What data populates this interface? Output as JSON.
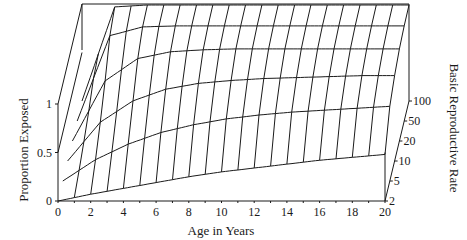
{
  "chart_data": {
    "type": "surface",
    "title": "",
    "xlabel": "Age in Years",
    "ylabel": "Proportion Exposed",
    "zlabel": "Basic Reproductive Rate",
    "x_ticks": [
      0,
      2,
      4,
      6,
      8,
      10,
      12,
      14,
      16,
      18,
      20
    ],
    "x_minor_step": 1,
    "xlim": [
      0,
      20
    ],
    "y_ticks": [
      0,
      0.5,
      1
    ],
    "ylim": [
      0,
      1
    ],
    "z_ticks": [
      2,
      5,
      10,
      20,
      50,
      100
    ],
    "z_scale": "log",
    "grid": false,
    "series_description": "Proportion exposed by age for each basic reproductive rate R0 (surface mesh)",
    "series": [
      {
        "name": "R0 = 2",
        "x": [
          0,
          2,
          4,
          6,
          8,
          10,
          12,
          14,
          16,
          18,
          20
        ],
        "values": [
          0,
          0.07,
          0.13,
          0.19,
          0.25,
          0.3,
          0.34,
          0.38,
          0.42,
          0.45,
          0.48
        ]
      },
      {
        "name": "R0 = 5",
        "x": [
          0,
          2,
          4,
          6,
          8,
          10,
          12,
          14,
          16,
          18,
          20
        ],
        "values": [
          0,
          0.22,
          0.38,
          0.5,
          0.58,
          0.64,
          0.68,
          0.71,
          0.73,
          0.75,
          0.77
        ]
      },
      {
        "name": "R0 = 10",
        "x": [
          0,
          2,
          4,
          6,
          8,
          10,
          12,
          14,
          16,
          18,
          20
        ],
        "values": [
          0,
          0.4,
          0.62,
          0.74,
          0.8,
          0.83,
          0.85,
          0.86,
          0.87,
          0.88,
          0.88
        ]
      },
      {
        "name": "R0 = 20",
        "x": [
          0,
          2,
          4,
          6,
          8,
          10,
          12,
          14,
          16,
          18,
          20
        ],
        "values": [
          0,
          0.62,
          0.85,
          0.92,
          0.94,
          0.95,
          0.95,
          0.95,
          0.95,
          0.95,
          0.95
        ]
      },
      {
        "name": "R0 = 50",
        "x": [
          0,
          2,
          4,
          6,
          8,
          10,
          12,
          14,
          16,
          18,
          20
        ],
        "values": [
          0,
          0.88,
          0.97,
          0.98,
          0.98,
          0.98,
          0.98,
          0.98,
          0.98,
          0.98,
          0.98
        ]
      },
      {
        "name": "R0 = 100",
        "x": [
          0,
          2,
          4,
          6,
          8,
          10,
          12,
          14,
          16,
          18,
          20
        ],
        "values": [
          0,
          0.97,
          0.99,
          0.99,
          0.99,
          0.99,
          0.99,
          0.99,
          0.99,
          0.99,
          0.99
        ]
      }
    ]
  },
  "axes": {
    "x_title": "Age in Years",
    "y_title": "Proportion Exposed",
    "z_title": "Basic Reproductive Rate",
    "x_labels": [
      "0",
      "2",
      "4",
      "6",
      "8",
      "10",
      "12",
      "14",
      "16",
      "18",
      "20"
    ],
    "y_labels": [
      "0",
      "0.5",
      "1"
    ],
    "z_labels": [
      "2",
      "5",
      "10",
      "20",
      "50",
      "100"
    ]
  },
  "colors": {
    "ink": "#1a1a1a",
    "background": "#ffffff"
  }
}
